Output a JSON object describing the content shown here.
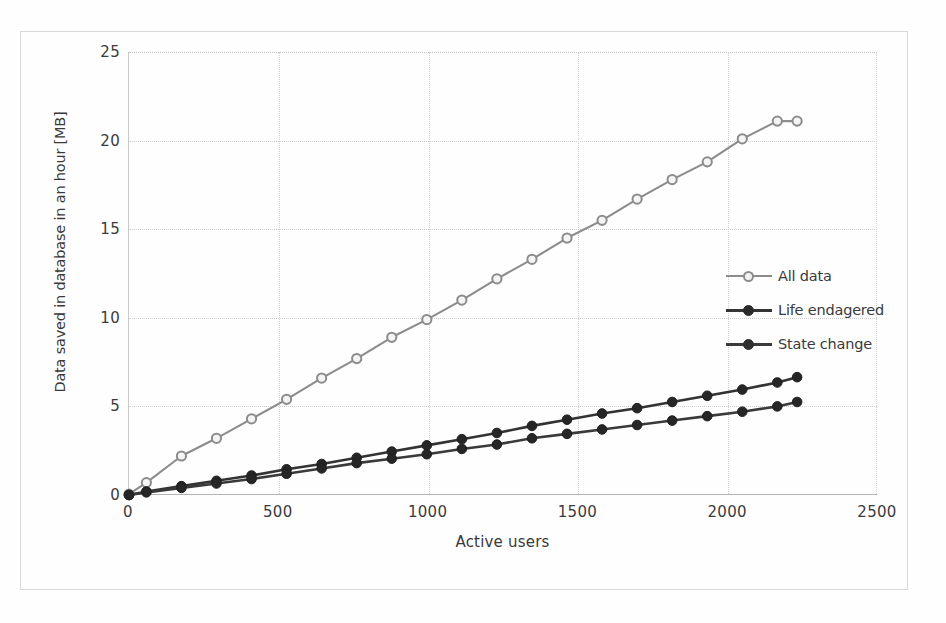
{
  "chart_data": {
    "type": "line",
    "title": "",
    "xlabel": "Active users",
    "ylabel": "Data saved in database in an hour [MB]",
    "xlim": [
      0,
      2500
    ],
    "ylim": [
      0,
      25
    ],
    "xticks": [
      0,
      500,
      1000,
      1500,
      2000,
      2500
    ],
    "yticks": [
      0,
      5,
      10,
      15,
      20,
      25
    ],
    "grid": true,
    "legend_position": "center-right",
    "x": [
      0,
      58,
      175,
      292,
      409,
      526,
      643,
      760,
      877,
      994,
      1111,
      1228,
      1345,
      1462,
      1579,
      1696,
      1813,
      1930,
      2047,
      2164,
      2230
    ],
    "series": [
      {
        "name": "All data",
        "color": "#8c8c8c",
        "marker": "open-circle",
        "values": [
          0.05,
          0.7,
          2.2,
          3.2,
          4.3,
          5.4,
          6.6,
          7.7,
          8.9,
          9.9,
          11.0,
          12.2,
          13.3,
          14.5,
          15.5,
          16.7,
          17.8,
          18.8,
          20.1,
          21.1,
          21.1
        ]
      },
      {
        "name": "Life endagered",
        "color": "#333333",
        "marker": "filled-circle",
        "values": [
          0.0,
          0.2,
          0.5,
          0.8,
          1.1,
          1.45,
          1.75,
          2.1,
          2.45,
          2.8,
          3.15,
          3.5,
          3.9,
          4.25,
          4.6,
          4.9,
          5.25,
          5.6,
          5.95,
          6.35,
          6.65
        ]
      },
      {
        "name": "State change",
        "color": "#3a3a3a",
        "marker": "filled-circle",
        "values": [
          0.0,
          0.15,
          0.4,
          0.65,
          0.9,
          1.2,
          1.5,
          1.8,
          2.05,
          2.3,
          2.6,
          2.85,
          3.2,
          3.45,
          3.7,
          3.95,
          4.2,
          4.45,
          4.7,
          5.0,
          5.25
        ]
      }
    ]
  },
  "axes": {
    "ylabel": "Data saved in database in an hour [MB]",
    "xlabel": "Active users",
    "yticks": [
      "0",
      "5",
      "10",
      "15",
      "20",
      "25"
    ],
    "xticks": [
      "0",
      "500",
      "1000",
      "1500",
      "2000",
      "2500"
    ]
  },
  "legend": {
    "items": [
      {
        "label": "All data",
        "color": "#8c8c8c",
        "marker": "open-circle"
      },
      {
        "label": "Life endagered",
        "color": "#333333",
        "marker": "filled-circle"
      },
      {
        "label": "State change",
        "color": "#3a3a3a",
        "marker": "filled-circle"
      }
    ]
  },
  "colors": {
    "grid": "#cfcfcf",
    "axis": "#b3b3b3",
    "frame": "#d9d9d9",
    "text": "#3a3a3a",
    "background": "#fefefe"
  }
}
